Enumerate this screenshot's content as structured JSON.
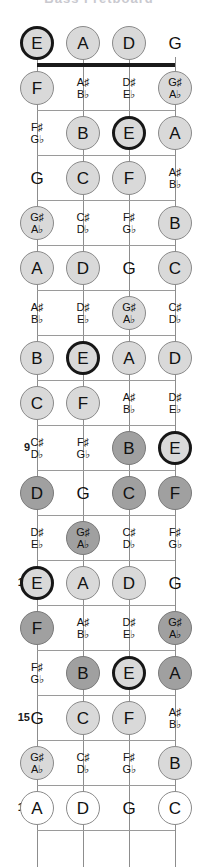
{
  "title": "Bass Fretboard",
  "geometry": {
    "width": 198,
    "height": 867,
    "string_x": [
      37,
      83,
      129,
      175
    ],
    "fret_y": [
      43,
      88,
      133,
      178,
      223,
      268,
      313,
      358,
      403,
      448,
      493,
      538,
      583,
      628,
      673,
      718,
      763,
      808
    ],
    "fretline_y": [
      63,
      110,
      155,
      200,
      245,
      290,
      335,
      380,
      425,
      470,
      515,
      560,
      605,
      650,
      695,
      740,
      785,
      830
    ],
    "nut_y": 63,
    "board_left": 37,
    "board_right": 175
  },
  "strings": [
    {
      "name": "E-string",
      "open_note": "E"
    },
    {
      "name": "A-string",
      "open_note": "A"
    },
    {
      "name": "D-string",
      "open_note": "D"
    },
    {
      "name": "G-string",
      "open_note": "G"
    }
  ],
  "fret_numbers": [
    {
      "fret": 5,
      "label": "5"
    },
    {
      "fret": 7,
      "label": "7"
    },
    {
      "fret": 9,
      "label": "9"
    },
    {
      "fret": 12,
      "label": "12"
    },
    {
      "fret": 15,
      "label": "15"
    },
    {
      "fret": 17,
      "label": "17"
    }
  ],
  "styles": {
    "ring": "#171717",
    "dark_fill": "#a0a0a0",
    "light_fill": "#d9d9d9",
    "white_fill": "#ffffff",
    "line": "#9a9a9a",
    "nut": "#1a1a1a",
    "text": "#111111"
  },
  "rows": [
    {
      "fret": 0,
      "notes": [
        {
          "string": 0,
          "natural": "E",
          "style": "ring"
        },
        {
          "string": 1,
          "natural": "A",
          "style": "light"
        },
        {
          "string": 2,
          "natural": "D",
          "style": "light"
        },
        {
          "string": 3,
          "natural": "G",
          "style": "none"
        }
      ]
    },
    {
      "fret": 1,
      "notes": [
        {
          "string": 0,
          "natural": "F",
          "style": "light"
        },
        {
          "string": 1,
          "sharp": "A♯",
          "flat": "B♭",
          "style": "none"
        },
        {
          "string": 2,
          "sharp": "D♯",
          "flat": "E♭",
          "style": "none"
        },
        {
          "string": 3,
          "sharp": "G♯",
          "flat": "A♭",
          "style": "light"
        }
      ]
    },
    {
      "fret": 2,
      "notes": [
        {
          "string": 0,
          "sharp": "F♯",
          "flat": "G♭",
          "style": "none"
        },
        {
          "string": 1,
          "natural": "B",
          "style": "light"
        },
        {
          "string": 2,
          "natural": "E",
          "style": "ring"
        },
        {
          "string": 3,
          "natural": "A",
          "style": "light"
        }
      ]
    },
    {
      "fret": 3,
      "notes": [
        {
          "string": 0,
          "natural": "G",
          "style": "none"
        },
        {
          "string": 1,
          "natural": "C",
          "style": "light"
        },
        {
          "string": 2,
          "natural": "F",
          "style": "light"
        },
        {
          "string": 3,
          "sharp": "A♯",
          "flat": "B♭",
          "style": "none"
        }
      ]
    },
    {
      "fret": 4,
      "notes": [
        {
          "string": 0,
          "sharp": "G♯",
          "flat": "A♭",
          "style": "light"
        },
        {
          "string": 1,
          "sharp": "C♯",
          "flat": "D♭",
          "style": "none"
        },
        {
          "string": 2,
          "sharp": "F♯",
          "flat": "G♭",
          "style": "none"
        },
        {
          "string": 3,
          "natural": "B",
          "style": "light"
        }
      ]
    },
    {
      "fret": 5,
      "notes": [
        {
          "string": 0,
          "natural": "A",
          "style": "light"
        },
        {
          "string": 1,
          "natural": "D",
          "style": "light"
        },
        {
          "string": 2,
          "natural": "G",
          "style": "none"
        },
        {
          "string": 3,
          "natural": "C",
          "style": "light"
        }
      ]
    },
    {
      "fret": 6,
      "notes": [
        {
          "string": 0,
          "sharp": "A♯",
          "flat": "B♭",
          "style": "none"
        },
        {
          "string": 1,
          "sharp": "D♯",
          "flat": "E♭",
          "style": "none"
        },
        {
          "string": 2,
          "sharp": "G♯",
          "flat": "A♭",
          "style": "light"
        },
        {
          "string": 3,
          "sharp": "C♯",
          "flat": "D♭",
          "style": "none"
        }
      ]
    },
    {
      "fret": 7,
      "notes": [
        {
          "string": 0,
          "natural": "B",
          "style": "light"
        },
        {
          "string": 1,
          "natural": "E",
          "style": "ring"
        },
        {
          "string": 2,
          "natural": "A",
          "style": "light"
        },
        {
          "string": 3,
          "natural": "D",
          "style": "light"
        }
      ]
    },
    {
      "fret": 8,
      "notes": [
        {
          "string": 0,
          "natural": "C",
          "style": "light"
        },
        {
          "string": 1,
          "natural": "F",
          "style": "light"
        },
        {
          "string": 2,
          "sharp": "A♯",
          "flat": "B♭",
          "style": "none"
        },
        {
          "string": 3,
          "sharp": "D♯",
          "flat": "E♭",
          "style": "none"
        }
      ]
    },
    {
      "fret": 9,
      "notes": [
        {
          "string": 0,
          "sharp": "C♯",
          "flat": "D♭",
          "style": "none"
        },
        {
          "string": 1,
          "sharp": "F♯",
          "flat": "G♭",
          "style": "none"
        },
        {
          "string": 2,
          "natural": "B",
          "style": "dark"
        },
        {
          "string": 3,
          "natural": "E",
          "style": "ring"
        }
      ]
    },
    {
      "fret": 10,
      "notes": [
        {
          "string": 0,
          "natural": "D",
          "style": "dark"
        },
        {
          "string": 1,
          "natural": "G",
          "style": "none"
        },
        {
          "string": 2,
          "natural": "C",
          "style": "dark"
        },
        {
          "string": 3,
          "natural": "F",
          "style": "dark"
        }
      ]
    },
    {
      "fret": 11,
      "notes": [
        {
          "string": 0,
          "sharp": "D♯",
          "flat": "E♭",
          "style": "none"
        },
        {
          "string": 1,
          "sharp": "G♯",
          "flat": "A♭",
          "style": "dark"
        },
        {
          "string": 2,
          "sharp": "C♯",
          "flat": "D♭",
          "style": "none"
        },
        {
          "string": 3,
          "sharp": "F♯",
          "flat": "G♭",
          "style": "none"
        }
      ]
    },
    {
      "fret": 12,
      "notes": [
        {
          "string": 0,
          "natural": "E",
          "style": "ring"
        },
        {
          "string": 1,
          "natural": "A",
          "style": "light"
        },
        {
          "string": 2,
          "natural": "D",
          "style": "light"
        },
        {
          "string": 3,
          "natural": "G",
          "style": "none"
        }
      ]
    },
    {
      "fret": 13,
      "notes": [
        {
          "string": 0,
          "natural": "F",
          "style": "dark"
        },
        {
          "string": 1,
          "sharp": "A♯",
          "flat": "B♭",
          "style": "none"
        },
        {
          "string": 2,
          "sharp": "D♯",
          "flat": "E♭",
          "style": "none"
        },
        {
          "string": 3,
          "sharp": "G♯",
          "flat": "A♭",
          "style": "dark"
        }
      ]
    },
    {
      "fret": 14,
      "notes": [
        {
          "string": 0,
          "sharp": "F♯",
          "flat": "G♭",
          "style": "none"
        },
        {
          "string": 1,
          "natural": "B",
          "style": "dark"
        },
        {
          "string": 2,
          "natural": "E",
          "style": "ring"
        },
        {
          "string": 3,
          "natural": "A",
          "style": "dark"
        }
      ]
    },
    {
      "fret": 15,
      "notes": [
        {
          "string": 0,
          "natural": "G",
          "style": "none"
        },
        {
          "string": 1,
          "natural": "C",
          "style": "light"
        },
        {
          "string": 2,
          "natural": "F",
          "style": "light"
        },
        {
          "string": 3,
          "sharp": "A♯",
          "flat": "B♭",
          "style": "none"
        }
      ]
    },
    {
      "fret": 16,
      "notes": [
        {
          "string": 0,
          "sharp": "G♯",
          "flat": "A♭",
          "style": "light"
        },
        {
          "string": 1,
          "sharp": "C♯",
          "flat": "D♭",
          "style": "none"
        },
        {
          "string": 2,
          "sharp": "F♯",
          "flat": "G♭",
          "style": "none"
        },
        {
          "string": 3,
          "natural": "B",
          "style": "light"
        }
      ]
    },
    {
      "fret": 17,
      "notes": [
        {
          "string": 0,
          "natural": "A",
          "style": "white"
        },
        {
          "string": 1,
          "natural": "D",
          "style": "white"
        },
        {
          "string": 2,
          "natural": "G",
          "style": "none"
        },
        {
          "string": 3,
          "natural": "C",
          "style": "white"
        }
      ]
    }
  ]
}
